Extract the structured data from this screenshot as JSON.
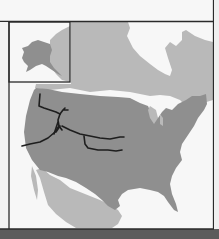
{
  "map": {
    "title": "",
    "region": "North America",
    "colors": {
      "water": "#f7f7f7",
      "highlight_land": "#8f8f8f",
      "other_land": "#b9b9b9",
      "border": "#2a2a2a",
      "trails": "#1e1e1e",
      "bottom_bar": "#5c5c5c"
    },
    "inset": {
      "label": "",
      "region": "Alaska"
    },
    "features": [
      {
        "name": "contiguous-united-states",
        "shade": "dark"
      },
      {
        "name": "alaska",
        "shade": "dark"
      },
      {
        "name": "canada",
        "shade": "light"
      },
      {
        "name": "mexico",
        "shade": "light"
      },
      {
        "name": "trail-network",
        "shade": "line"
      }
    ]
  }
}
